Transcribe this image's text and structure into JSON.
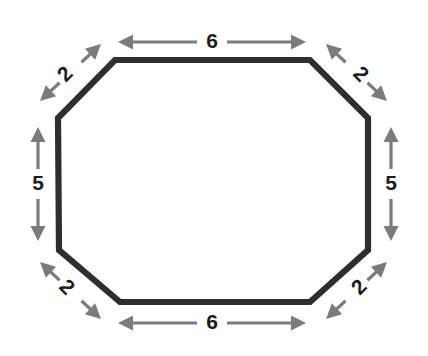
{
  "figure": {
    "background_color": "#ffffff",
    "shape": {
      "name": "octagon",
      "outline_color": "#2e2e2e",
      "fill_color": "#ffffff",
      "stroke_width": 6.2,
      "vertices": [
        [
          115,
          60
        ],
        [
          310,
          60
        ],
        [
          368,
          118
        ],
        [
          368,
          250
        ],
        [
          310,
          302
        ],
        [
          120,
          302
        ],
        [
          59,
          250
        ],
        [
          58,
          118
        ]
      ]
    },
    "dimension_color": "#7b7b7b",
    "label_color": "#1c1c1c",
    "dimensions": [
      {
        "id": "top-side",
        "label": "6",
        "orientation": "horizontal",
        "position": "top",
        "rotation_deg": 0,
        "label_x": 212,
        "label_y": 42,
        "arrow_x1": 118,
        "arrow_y1": 42,
        "arrow_x2": 306,
        "arrow_y2": 42
      },
      {
        "id": "top-left-diagonal",
        "label": "2",
        "orientation": "diagonal",
        "position": "top-left",
        "rotation_deg": -45,
        "label_x": 66,
        "label_y": 75,
        "arrow_x1": 40,
        "arrow_y1": 101,
        "arrow_x2": 101,
        "arrow_y2": 44
      },
      {
        "id": "top-right-diagonal",
        "label": "2",
        "orientation": "diagonal",
        "position": "top-right",
        "rotation_deg": 45,
        "label_x": 360,
        "label_y": 75,
        "arrow_x1": 326,
        "arrow_y1": 44,
        "arrow_x2": 387,
        "arrow_y2": 101
      },
      {
        "id": "left-side",
        "label": "5",
        "orientation": "vertical",
        "position": "left",
        "rotation_deg": 0,
        "label_x": 38,
        "label_y": 184,
        "arrow_x1": 38,
        "arrow_y1": 127,
        "arrow_x2": 38,
        "arrow_y2": 241
      },
      {
        "id": "right-side",
        "label": "5",
        "orientation": "vertical",
        "position": "right",
        "rotation_deg": 0,
        "label_x": 391,
        "label_y": 184,
        "arrow_x1": 391,
        "arrow_y1": 127,
        "arrow_x2": 391,
        "arrow_y2": 241
      },
      {
        "id": "bottom-left-diagonal",
        "label": "2",
        "orientation": "diagonal",
        "position": "bottom-left",
        "rotation_deg": 45,
        "label_x": 66,
        "label_y": 288,
        "arrow_x1": 40,
        "arrow_y1": 262,
        "arrow_x2": 101,
        "arrow_y2": 319
      },
      {
        "id": "bottom-right-diagonal",
        "label": "2",
        "orientation": "diagonal",
        "position": "bottom-right",
        "rotation_deg": -45,
        "label_x": 360,
        "label_y": 288,
        "arrow_x1": 326,
        "arrow_y1": 319,
        "arrow_x2": 387,
        "arrow_y2": 262
      },
      {
        "id": "bottom-side",
        "label": "6",
        "orientation": "horizontal",
        "position": "bottom",
        "rotation_deg": 0,
        "label_x": 212,
        "label_y": 323,
        "arrow_x1": 118,
        "arrow_y1": 323,
        "arrow_x2": 306,
        "arrow_y2": 323
      }
    ]
  },
  "chart_data": {
    "type": "diagram",
    "shape": "octagon",
    "side_labels": [
      "6",
      "2",
      "2",
      "5",
      "5",
      "2",
      "2",
      "6"
    ],
    "sides": [
      {
        "position": "top",
        "length": 6
      },
      {
        "position": "top-left",
        "length": 2
      },
      {
        "position": "top-right",
        "length": 2
      },
      {
        "position": "left",
        "length": 5
      },
      {
        "position": "right",
        "length": 5
      },
      {
        "position": "bottom-left",
        "length": 2
      },
      {
        "position": "bottom-right",
        "length": 2
      },
      {
        "position": "bottom",
        "length": 6
      }
    ]
  }
}
